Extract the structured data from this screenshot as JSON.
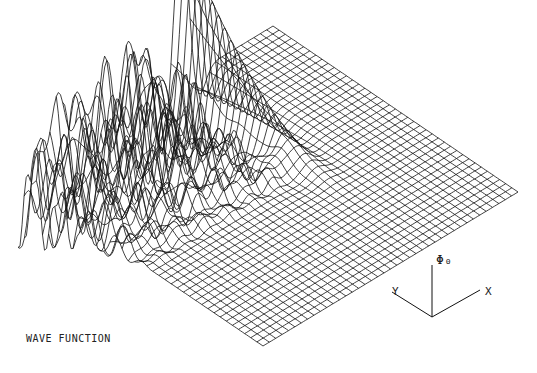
{
  "chart_data": {
    "type": "surface-wireframe",
    "title": "WAVE FUNCTION",
    "axes": {
      "x_label": "X",
      "y_label": "Y",
      "z_label": "Φ₀"
    },
    "grid": {
      "nx": 40,
      "ny": 40
    },
    "projection": {
      "origin_front": [
        263,
        346
      ],
      "x_dir_end": [
        518,
        192
      ],
      "y_dir_end": [
        18,
        180
      ],
      "z_scale": 150
    },
    "features": [
      {
        "name": "main ridge peak",
        "x": 0.62,
        "y": 0.98,
        "height": 1.0
      },
      {
        "name": "secondary oscillating ridge",
        "y_range": [
          0.5,
          1.0
        ],
        "x_range": [
          0.0,
          0.6
        ]
      },
      {
        "name": "left-edge negative spikes",
        "x": 0.0,
        "y_range": [
          0.7,
          1.0
        ]
      }
    ],
    "line_color": "#111111",
    "background": "#ffffff"
  },
  "axis_triad": {
    "origin": [
      432,
      317
    ],
    "y_end": [
      392,
      292
    ],
    "x_end": [
      480,
      290
    ],
    "z_end": [
      432,
      265
    ]
  }
}
